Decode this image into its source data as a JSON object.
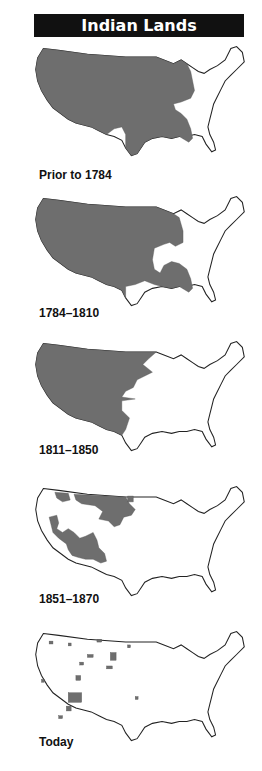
{
  "title": "Indian Lands",
  "colors": {
    "title_bar_bg": "#111111",
    "title_text": "#ffffff",
    "indian_land": "#6e6e6e",
    "background": "#ffffff",
    "outline": "#222222"
  },
  "panels": [
    {
      "label": "Prior to 1784",
      "description": "Nearly entire US shaded except Northeast/Atlantic coast and Texas area"
    },
    {
      "label": "1784–1810",
      "description": "Western two-thirds plus Southeast shaded; Ohio valley and Texas area unshaded"
    },
    {
      "label": "1811–1850",
      "description": "Everything west of roughly the Mississippi/plains frontier shaded"
    },
    {
      "label": "1851–1870",
      "description": "Scattered large areas in northern plains and Southwest remain"
    },
    {
      "label": "Today",
      "description": "Small scattered reservations, largest in the Southwest"
    }
  ]
}
